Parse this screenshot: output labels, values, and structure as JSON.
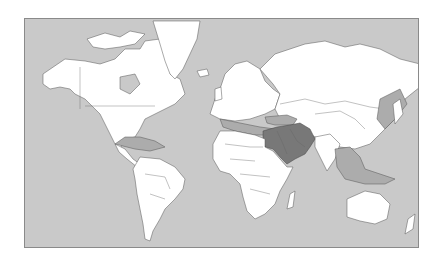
{
  "map": {
    "projection": "mercator",
    "type": "world-political-choropleth",
    "colors": {
      "ocean": "#c9c9c9",
      "land": "#ffffff",
      "secondary_region": "#acacac",
      "primary_region": "#787878",
      "frame": "#8a8a8a"
    },
    "highlighted_regions": {
      "primary": [
        "Egypt",
        "Israel",
        "Jordan",
        "Syria",
        "Iraq",
        "Saudi Arabia",
        "Iran",
        "Kuwait",
        "Qatar",
        "UAE",
        "Oman",
        "Yemen",
        "Lebanon"
      ],
      "secondary": [
        "Mediterranean Sea",
        "Turkey",
        "Caucasus",
        "Caribbean",
        "East Asia coast",
        "Southeast Asia"
      ]
    }
  }
}
